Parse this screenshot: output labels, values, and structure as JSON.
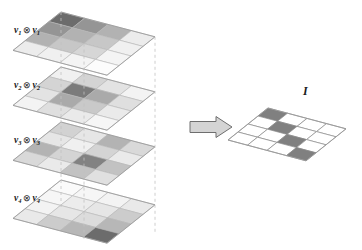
{
  "figure": {
    "grid_size": 4,
    "colors": {
      "cell_stroke": "#9a9a9a",
      "cell_stroke_light": "#b5b5b5",
      "dashed_guide": "#c2c2c2",
      "identity_fill": "#808080",
      "identity_stroke": "#8a8a8a",
      "arrow_fill": "#d4d4d4",
      "arrow_stroke": "#6e6e6e",
      "text": "#1a1a1a",
      "background": "#ffffff"
    }
  },
  "layers": [
    {
      "id": "layer-1",
      "label_v": "v",
      "label_sub": "1",
      "operator": "⊗",
      "label_text": "v1 ⊗ v1",
      "peak_index": [
        0,
        0
      ],
      "weights": [
        1.0,
        0.72,
        0.52,
        0.12
      ],
      "matrix": [
        [
          1.0,
          0.72,
          0.52,
          0.12
        ],
        [
          0.72,
          0.52,
          0.37,
          0.09
        ],
        [
          0.52,
          0.37,
          0.27,
          0.06
        ],
        [
          0.12,
          0.09,
          0.06,
          0.01
        ]
      ]
    },
    {
      "id": "layer-2",
      "label_v": "v",
      "label_sub": "2",
      "operator": "⊗",
      "label_text": "v2 ⊗ v2",
      "peak_index": [
        1,
        1
      ],
      "weights": [
        0.3,
        0.95,
        0.6,
        0.22
      ],
      "matrix": [
        [
          0.09,
          0.28,
          0.18,
          0.07
        ],
        [
          0.28,
          0.9,
          0.57,
          0.21
        ],
        [
          0.18,
          0.57,
          0.36,
          0.13
        ],
        [
          0.07,
          0.21,
          0.13,
          0.05
        ]
      ]
    },
    {
      "id": "layer-3",
      "label_v": "v",
      "label_sub": "3",
      "operator": "⊗",
      "label_text": "v3 ⊗ v3",
      "peak_index": [
        2,
        2
      ],
      "weights": [
        0.55,
        0.3,
        0.92,
        0.45
      ],
      "matrix": [
        [
          0.3,
          0.16,
          0.51,
          0.25
        ],
        [
          0.16,
          0.09,
          0.28,
          0.13
        ],
        [
          0.51,
          0.28,
          0.85,
          0.41
        ],
        [
          0.25,
          0.13,
          0.41,
          0.2
        ]
      ]
    },
    {
      "id": "layer-4",
      "label_v": "v",
      "label_sub": "4",
      "operator": "⊗",
      "label_text": "v4 ⊗ v4",
      "peak_index": [
        3,
        3
      ],
      "weights": [
        0.14,
        0.34,
        0.48,
        1.0
      ],
      "matrix": [
        [
          0.02,
          0.05,
          0.07,
          0.14
        ],
        [
          0.05,
          0.12,
          0.16,
          0.34
        ],
        [
          0.07,
          0.16,
          0.23,
          0.48
        ],
        [
          0.14,
          0.34,
          0.48,
          1.0
        ]
      ]
    }
  ],
  "arrow": {
    "name": "implies-arrow",
    "direction": "right",
    "label": ""
  },
  "result": {
    "label": "I",
    "name": "identity-matrix",
    "grid_size": 4,
    "matrix": [
      [
        1,
        0,
        0,
        0
      ],
      [
        0,
        1,
        0,
        0
      ],
      [
        0,
        0,
        1,
        0
      ],
      [
        0,
        0,
        0,
        1
      ]
    ]
  }
}
